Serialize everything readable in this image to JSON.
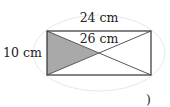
{
  "diagram": {
    "type": "rectangle-with-diagonals",
    "labels": {
      "top_width": "24 cm",
      "diagonal": "26 cm",
      "left_height": "10 cm"
    },
    "shaded_region": "left triangle formed by the two diagonals",
    "colors": {
      "stroke": "#333333",
      "shade": "#a9a9a9",
      "ellipse": "#e6e6e6"
    },
    "trailing_mark": ")"
  }
}
